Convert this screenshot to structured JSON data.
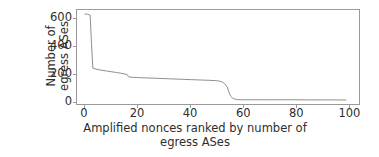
{
  "chart_data": {
    "type": "line",
    "title": "",
    "xlabel": "Amplified nonces ranked by number of egress ASes",
    "xlabel_line1": "Amplified nonces ranked by number of",
    "xlabel_line2": "egress ASes",
    "ylabel": "Number of egress ASes",
    "ylabel_line1": "Number of",
    "ylabel_line2": "egress ASes",
    "xlim": [
      -3,
      104
    ],
    "ylim": [
      -25,
      665
    ],
    "xticks": [
      0,
      20,
      40,
      60,
      80,
      100
    ],
    "xticklabels": [
      "0",
      "20",
      "40",
      "60",
      "80",
      "100"
    ],
    "yticks": [
      0,
      200,
      400,
      600
    ],
    "yticklabels": [
      "0",
      "200",
      "400",
      "600"
    ],
    "grid": false,
    "legend": null,
    "line_color": "#8c8c8c",
    "line_width": 1.0,
    "series": [
      {
        "name": "egress ASes per amplified nonce",
        "x": [
          0,
          1,
          2,
          2.5,
          3,
          4,
          5,
          6,
          8,
          10,
          12,
          14,
          15,
          16,
          16.5,
          17,
          18,
          20,
          24,
          28,
          32,
          36,
          40,
          44,
          47,
          49,
          50,
          51,
          52,
          53,
          54,
          54.5,
          55,
          55.5,
          56,
          57,
          58,
          60,
          65,
          70,
          75,
          80,
          85,
          90,
          95,
          99
        ],
        "y": [
          636,
          634,
          626,
          420,
          238,
          232,
          228,
          224,
          218,
          212,
          206,
          200,
          196,
          192,
          176,
          173,
          171,
          169,
          166,
          163,
          160,
          157,
          154,
          151,
          149,
          147,
          146,
          143,
          138,
          125,
          100,
          70,
          44,
          30,
          18,
          10,
          7,
          6,
          6,
          6,
          6,
          6,
          5,
          5,
          5,
          4
        ]
      }
    ]
  }
}
